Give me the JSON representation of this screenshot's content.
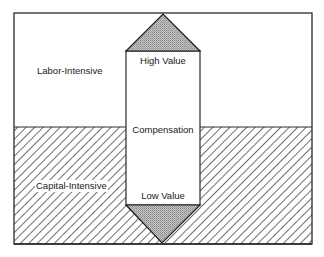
{
  "diagram": {
    "regions": {
      "upper": {
        "label": "Labor-Intensive",
        "fill": "#ffffff"
      },
      "lower": {
        "label": "Capital-Intensive",
        "fill": "hatched"
      }
    },
    "column": {
      "top_label": "High Value",
      "middle_label": "Compensation",
      "bottom_label": "Low Value"
    },
    "colors": {
      "stroke": "#2a2a2a",
      "hatch": "#4a4a4a",
      "triangle_fill": "#b4b4b4",
      "background": "#ffffff"
    }
  }
}
